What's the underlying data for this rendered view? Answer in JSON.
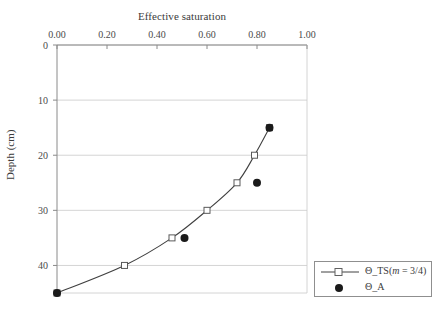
{
  "chart_data": {
    "type": "line",
    "title": "Effective saturation",
    "xlabel": "Effective saturation",
    "ylabel": "Depth (cm)",
    "xlim": [
      0.0,
      1.0
    ],
    "ylim": [
      0,
      45
    ],
    "y_inverted": true,
    "grid": true,
    "xticks": [
      "0.00",
      "0.20",
      "0.40",
      "0.60",
      "0.80",
      "1.00"
    ],
    "xtick_values": [
      0.0,
      0.2,
      0.4,
      0.6,
      0.8,
      1.0
    ],
    "yticks": [
      "0",
      "10",
      "20",
      "30",
      "40"
    ],
    "ytick_values": [
      0,
      10,
      20,
      30,
      40
    ],
    "legend_position": "outside-bottom-right",
    "series": [
      {
        "name": "Θ_TS(m = 3/4)",
        "name_prefix": "Θ_TS(",
        "name_italic": "m",
        "name_suffix": " = 3/4)",
        "marker": "open-square",
        "line": "solid",
        "color": "#404040",
        "x": [
          0.0,
          0.27,
          0.46,
          0.6,
          0.72,
          0.79,
          0.85
        ],
        "y": [
          45.0,
          40.0,
          35.0,
          30.0,
          25.0,
          20.0,
          15.0
        ]
      },
      {
        "name": "Θ_A",
        "marker": "filled-circle",
        "line": "none",
        "color": "#1a1a1a",
        "x": [
          0.0,
          0.51,
          0.8,
          0.85
        ],
        "y": [
          45.0,
          35.0,
          25.0,
          15.0
        ]
      }
    ]
  },
  "legend": {
    "items": [
      {
        "label_prefix": "Θ_TS(",
        "label_italic": "m",
        "label_suffix": " = 3/4)",
        "symbol": "line-open-square"
      },
      {
        "label_prefix": "Θ_A",
        "label_italic": "",
        "label_suffix": "",
        "symbol": "filled-circle"
      }
    ]
  }
}
